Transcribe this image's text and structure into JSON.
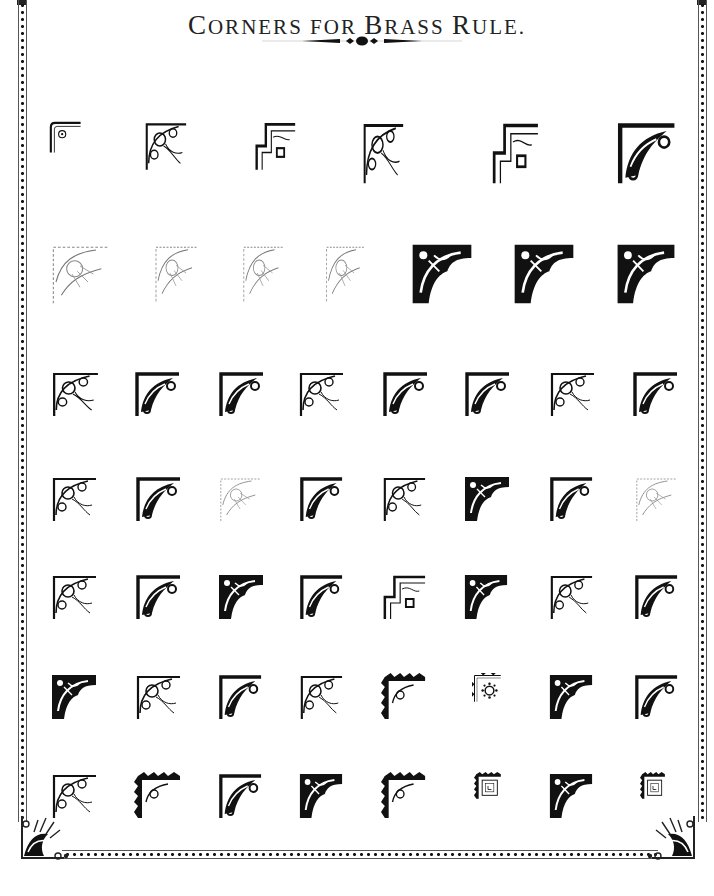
{
  "page": {
    "title_parts": [
      {
        "cap": "C",
        "rest": "ORNERS"
      },
      {
        "cap": "",
        "rest": " FOR "
      },
      {
        "cap": "B",
        "rest": "RASS"
      },
      {
        "cap": "",
        "rest": " "
      },
      {
        "cap": "R",
        "rest": "ULE."
      }
    ],
    "title": "Corners for Brass Rule.",
    "ink_color": "#111111",
    "paper_color": "#ffffff"
  },
  "rows": [
    {
      "top": 120,
      "items": [
        {
          "x": 48,
          "w": 34,
          "h": 34,
          "style": "line"
        },
        {
          "x": 143,
          "w": 45,
          "h": 52,
          "style": "scroll"
        },
        {
          "x": 253,
          "w": 44,
          "h": 52,
          "style": "step"
        },
        {
          "x": 361,
          "w": 44,
          "h": 66,
          "style": "scroll"
        },
        {
          "x": 490,
          "w": 50,
          "h": 66,
          "style": "step"
        },
        {
          "x": 615,
          "w": 62,
          "h": 66,
          "style": "bold"
        }
      ]
    },
    {
      "top": 242,
      "items": [
        {
          "x": 48,
          "w": 64,
          "h": 64,
          "style": "faint"
        },
        {
          "x": 152,
          "w": 48,
          "h": 62,
          "style": "faint"
        },
        {
          "x": 240,
          "w": 46,
          "h": 62,
          "style": "faint"
        },
        {
          "x": 323,
          "w": 44,
          "h": 62,
          "style": "faint"
        },
        {
          "x": 410,
          "w": 64,
          "h": 64,
          "style": "solid"
        },
        {
          "x": 512,
          "w": 64,
          "h": 64,
          "style": "solid"
        },
        {
          "x": 615,
          "w": 62,
          "h": 64,
          "style": "solid"
        }
      ]
    },
    {
      "top": 370,
      "items": [
        {
          "x": 50,
          "w": 50,
          "h": 48,
          "style": "scroll"
        },
        {
          "x": 133,
          "w": 48,
          "h": 48,
          "style": "bold"
        },
        {
          "x": 217,
          "w": 48,
          "h": 48,
          "style": "bold"
        },
        {
          "x": 297,
          "w": 48,
          "h": 48,
          "style": "scroll"
        },
        {
          "x": 381,
          "w": 48,
          "h": 48,
          "style": "bold"
        },
        {
          "x": 463,
          "w": 48,
          "h": 48,
          "style": "bold"
        },
        {
          "x": 548,
          "w": 48,
          "h": 48,
          "style": "scroll"
        },
        {
          "x": 631,
          "w": 48,
          "h": 48,
          "style": "bold"
        }
      ]
    },
    {
      "top": 475,
      "items": [
        {
          "x": 50,
          "w": 48,
          "h": 48,
          "style": "scroll"
        },
        {
          "x": 134,
          "w": 48,
          "h": 48,
          "style": "bold"
        },
        {
          "x": 217,
          "w": 46,
          "h": 48,
          "style": "faint"
        },
        {
          "x": 298,
          "w": 46,
          "h": 48,
          "style": "bold"
        },
        {
          "x": 381,
          "w": 46,
          "h": 48,
          "style": "scroll"
        },
        {
          "x": 463,
          "w": 48,
          "h": 48,
          "style": "solid"
        },
        {
          "x": 548,
          "w": 46,
          "h": 48,
          "style": "bold"
        },
        {
          "x": 633,
          "w": 46,
          "h": 48,
          "style": "faint"
        }
      ]
    },
    {
      "top": 573,
      "items": [
        {
          "x": 50,
          "w": 48,
          "h": 48,
          "style": "scroll"
        },
        {
          "x": 134,
          "w": 48,
          "h": 48,
          "style": "bold"
        },
        {
          "x": 217,
          "w": 48,
          "h": 48,
          "style": "solid"
        },
        {
          "x": 298,
          "w": 46,
          "h": 48,
          "style": "bold"
        },
        {
          "x": 381,
          "w": 46,
          "h": 48,
          "style": "step"
        },
        {
          "x": 463,
          "w": 46,
          "h": 48,
          "style": "solid"
        },
        {
          "x": 548,
          "w": 46,
          "h": 48,
          "style": "scroll"
        },
        {
          "x": 633,
          "w": 46,
          "h": 48,
          "style": "bold"
        }
      ]
    },
    {
      "top": 673,
      "items": [
        {
          "x": 50,
          "w": 48,
          "h": 48,
          "style": "solid"
        },
        {
          "x": 134,
          "w": 48,
          "h": 48,
          "style": "scroll"
        },
        {
          "x": 217,
          "w": 46,
          "h": 48,
          "style": "bold"
        },
        {
          "x": 298,
          "w": 46,
          "h": 48,
          "style": "scroll"
        },
        {
          "x": 381,
          "w": 46,
          "h": 48,
          "style": "notch"
        },
        {
          "x": 472,
          "w": 30,
          "h": 30,
          "style": "sun"
        },
        {
          "x": 548,
          "w": 46,
          "h": 48,
          "style": "solid"
        },
        {
          "x": 633,
          "w": 46,
          "h": 48,
          "style": "bold"
        }
      ]
    },
    {
      "top": 772,
      "items": [
        {
          "x": 50,
          "w": 48,
          "h": 48,
          "style": "scroll"
        },
        {
          "x": 134,
          "w": 48,
          "h": 48,
          "style": "notch"
        },
        {
          "x": 217,
          "w": 46,
          "h": 48,
          "style": "bold"
        },
        {
          "x": 298,
          "w": 46,
          "h": 48,
          "style": "solid"
        },
        {
          "x": 381,
          "w": 46,
          "h": 48,
          "style": "notch"
        },
        {
          "x": 474,
          "w": 28,
          "h": 28,
          "style": "box"
        },
        {
          "x": 548,
          "w": 46,
          "h": 48,
          "style": "solid"
        },
        {
          "x": 640,
          "w": 26,
          "h": 28,
          "style": "box"
        }
      ]
    }
  ]
}
